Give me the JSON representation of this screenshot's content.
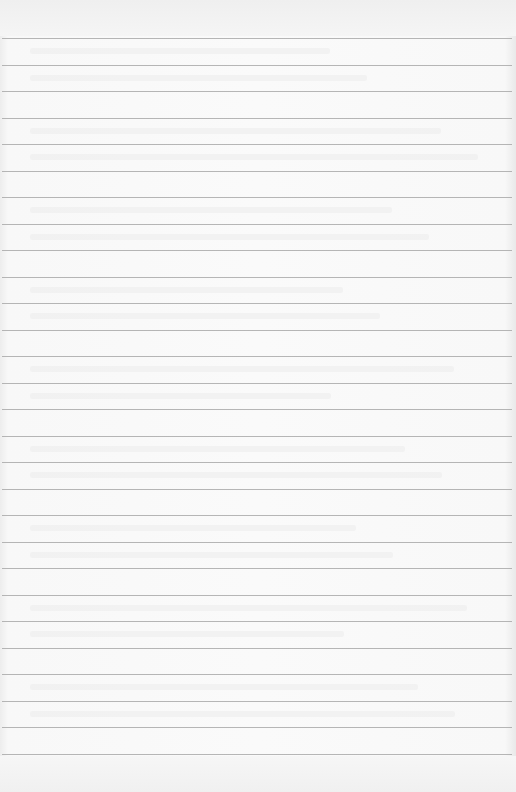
{
  "page": {
    "type": "ruled notebook page",
    "background_color": "#fafafa",
    "rule_color": "#a9a9a9",
    "rule_count": 28,
    "first_rule_y": 38,
    "rule_spacing": 26.5,
    "text": "",
    "note": "blank page with faint illegible show-through from reverse side"
  }
}
